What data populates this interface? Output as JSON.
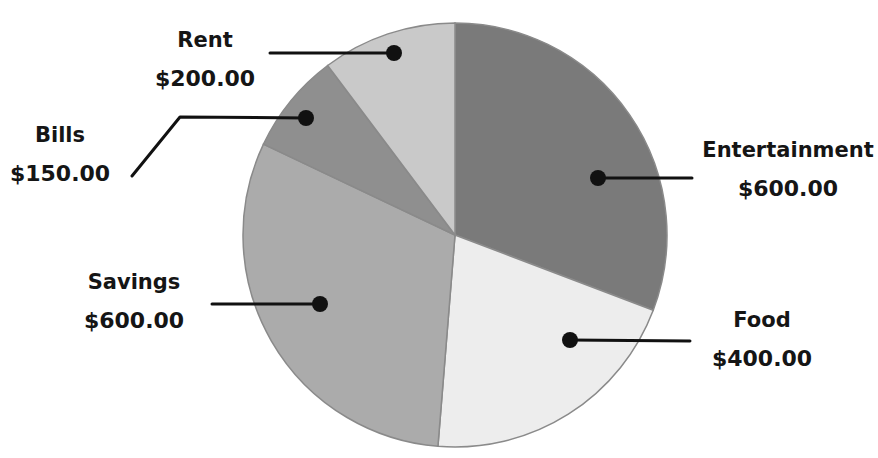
{
  "chart_data": {
    "type": "pie",
    "title": "",
    "title_note": "title cut off at top edge; only descenders visible",
    "categories": [
      "Entertainment",
      "Food",
      "Savings",
      "Bills",
      "Rent"
    ],
    "values": [
      600,
      400,
      600,
      150,
      200
    ],
    "value_labels": [
      "$600.00",
      "$400.00",
      "$600.00",
      "$150.00",
      "$200.00"
    ],
    "colors": [
      "#7a7a7a",
      "#ededed",
      "#ababab",
      "#8f8f8f",
      "#c9c9c9"
    ],
    "start_angle_deg": 0,
    "direction": "clockwise",
    "legend": "none (callout labels with leader lines)"
  },
  "labels": [
    {
      "name": "Entertainment",
      "value": "$600.00"
    },
    {
      "name": "Food",
      "value": "$400.00"
    },
    {
      "name": "Savings",
      "value": "$600.00"
    },
    {
      "name": "Bills",
      "value": "$150.00"
    },
    {
      "name": "Rent",
      "value": "$200.00"
    }
  ]
}
